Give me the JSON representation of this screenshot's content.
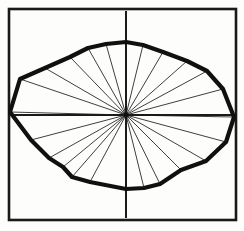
{
  "figure": {
    "type": "radial-polygon-plot",
    "background_color": "#fdfdfc",
    "ink_color": "#111111",
    "frame": {
      "name": "square-frame",
      "x": 9,
      "y": 9,
      "width": 227,
      "height": 211,
      "stroke_width": 2.6,
      "color": "#1a1a1a"
    },
    "axes": {
      "name": "crosshair-axes",
      "center_x": 126,
      "center_y": 115,
      "stroke_width": 2.0,
      "color": "#1a1a1a",
      "vertical_from_y": 11,
      "vertical_to_y": 218,
      "horizontal_from_x": 11,
      "horizontal_to_x": 234
    },
    "outline": {
      "name": "polygon-outline",
      "stroke_width": 4.2,
      "color": "#101010",
      "closed": true
    },
    "radii": {
      "name": "radial-spokes",
      "stroke_width": 0.85,
      "color": "#1c1c1c",
      "count": 24
    }
  },
  "chart_data": {
    "type": "line",
    "subtitle": "",
    "xlabel": "",
    "ylabel": "",
    "grid": false,
    "legend": false,
    "coordinate_system": "polar",
    "center": [
      126,
      115
    ],
    "angle_unit": "degrees",
    "angle_convention": "0 deg = right (+x), increasing counter-clockwise",
    "radius_unit": "pixels",
    "series": [
      {
        "name": "outline radius",
        "angles": [
          0,
          15,
          30,
          45,
          60,
          75,
          90,
          105,
          120,
          135,
          150,
          165,
          180,
          195,
          210,
          225,
          240,
          255,
          270,
          285,
          300,
          315,
          330,
          345
        ],
        "values": [
          108,
          100,
          92,
          80,
          72,
          70,
          72,
          74,
          78,
          82,
          94,
          110,
          116,
          98,
          86,
          70,
          64,
          70,
          74,
          70,
          68,
          78,
          92,
          104
        ]
      }
    ],
    "vertices_xy": [
      [
        234,
        117
      ],
      [
        223,
        89
      ],
      [
        207,
        71
      ],
      [
        187,
        61
      ],
      [
        163,
        52
      ],
      [
        143,
        45
      ],
      [
        126,
        42
      ],
      [
        106,
        44
      ],
      [
        88,
        48
      ],
      [
        70,
        57
      ],
      [
        45,
        68
      ],
      [
        20,
        79
      ],
      [
        10,
        112
      ],
      [
        31,
        140
      ],
      [
        49,
        158
      ],
      [
        63,
        167
      ],
      [
        72,
        177
      ],
      [
        90,
        182
      ],
      [
        126,
        189
      ],
      [
        144,
        188
      ],
      [
        160,
        184
      ],
      [
        181,
        170
      ],
      [
        206,
        161
      ],
      [
        226,
        142
      ]
    ],
    "annotations": []
  }
}
